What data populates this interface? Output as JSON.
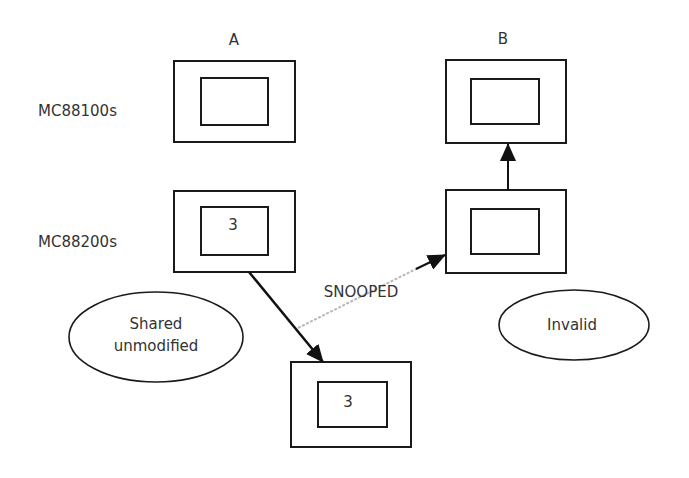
{
  "diagram": {
    "column_labels": {
      "a": "A",
      "b": "B"
    },
    "row_labels": {
      "top": "MC88100s",
      "bottom": "MC88200s"
    },
    "boxes": {
      "a_top": {
        "value": ""
      },
      "a_bottom": {
        "value": "3"
      },
      "b_top": {
        "value": ""
      },
      "b_bottom": {
        "value": ""
      },
      "memory": {
        "value": "3"
      }
    },
    "edge_labels": {
      "snoop": "SNOOPED"
    },
    "states": {
      "a": {
        "line1": "Shared",
        "line2": "unmodified"
      },
      "b": {
        "line1": "Invalid"
      }
    },
    "colors": {
      "stroke": "#1a1a1a",
      "snoop": "#b8b8b8",
      "background": "#ffffff"
    }
  }
}
